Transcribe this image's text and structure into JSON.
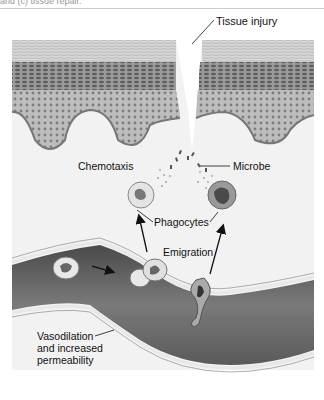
{
  "caption": "and (c) tissue repair.",
  "labels": {
    "tissue_injury": "Tissue injury",
    "chemotaxis": "Chemotaxis",
    "microbe": "Microbe",
    "phagocytes": "Phagocytes",
    "emigration": "Emigration",
    "vasodilation": [
      "Vasodilation",
      "and increased",
      "permeability"
    ]
  },
  "colors": {
    "background": "#f2f2f2",
    "epidermis_top": "#cfcfcf",
    "epidermis_mid": "#8a8a8a",
    "epidermis_base": "#b5b5b5",
    "vessel": "#6a6a6a",
    "vessel_wall": "#e6e6e6"
  }
}
